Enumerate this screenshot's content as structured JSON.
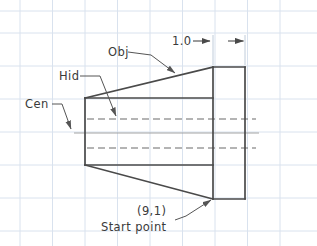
{
  "drawing": {
    "title": "CAD line-type demonstration sketch",
    "background_color": "#ffffff",
    "grid": {
      "color": "#d9e2ee",
      "spacing_px": 32.5,
      "vertical_lines_x": [
        20,
        52.5,
        85,
        117.5,
        150,
        182.5,
        215,
        247.5,
        280
      ],
      "horizontal_lines_y": [
        11,
        33,
        66,
        99,
        132,
        165,
        198,
        231
      ],
      "visible": true
    },
    "line_colors": {
      "object_line": "#4a4a4a",
      "hidden_line": "#6b6b6b",
      "center_line": "#8a8a8a",
      "leader_line": "#6b6b6b",
      "dimension_line": "#4a4a4a"
    },
    "geometry": {
      "object_outline_points": "85,98 213,67 245,67 245,199 213,199 85,165 85,98",
      "front_taper_top": "85,98 213,67",
      "front_taper_bottom": "85,165 213,199",
      "left_edge": "85,98 85,165",
      "inner_vertical_edge": "213,67 213,199",
      "rect_top": "213,67 245,67",
      "rect_right": "245,67 245,199",
      "rect_bottom": "213,199 245,199",
      "hidden_lines": [
        {
          "x1": 87,
          "y1": 119,
          "x2": 256,
          "y2": 119
        },
        {
          "x1": 87,
          "y1": 148,
          "x2": 256,
          "y2": 148
        }
      ],
      "center_line": {
        "x1": 74,
        "y1": 133,
        "x2": 259,
        "y2": 133
      }
    },
    "labels": {
      "obj": {
        "text": "Obj",
        "x": 108,
        "y": 56,
        "leader": "128,52 152,55 178,75",
        "arrow_at": [
          178,
          75
        ],
        "arrow_angle_deg": 38
      },
      "hid": {
        "text": "Hid",
        "x": 60,
        "y": 80,
        "leader": "80,76 101,76 118,119",
        "arrow_at": [
          118,
          119
        ],
        "arrow_angle_deg": 68
      },
      "cen": {
        "text": "Cen",
        "x": 26,
        "y": 108,
        "leader": "52,104 62,104 72,132",
        "arrow_at": [
          72,
          132
        ],
        "arrow_angle_deg": 70
      },
      "start_point_coord": {
        "text": "(9,1)",
        "x": 137,
        "y": 214
      },
      "start_point_caption": {
        "text": "Start point",
        "x": 103,
        "y": 230
      },
      "start_point_leader": {
        "path": "175,219 186,215 213,199",
        "arrow_at": [
          213,
          199
        ],
        "arrow_angle_deg": 210
      },
      "dimension": {
        "text": "1.0",
        "text_x": 172,
        "text_y": 45,
        "line": {
          "x1": 193,
          "y1": 41,
          "x2": 245,
          "y2": 41
        },
        "left_arrow_at": [
          213,
          41
        ],
        "right_arrow_at": [
          245,
          41
        ],
        "extension_left_x": 213,
        "extension_right_x": 245,
        "extension_y_top": 36,
        "extension_y_bottom": 67
      }
    }
  }
}
